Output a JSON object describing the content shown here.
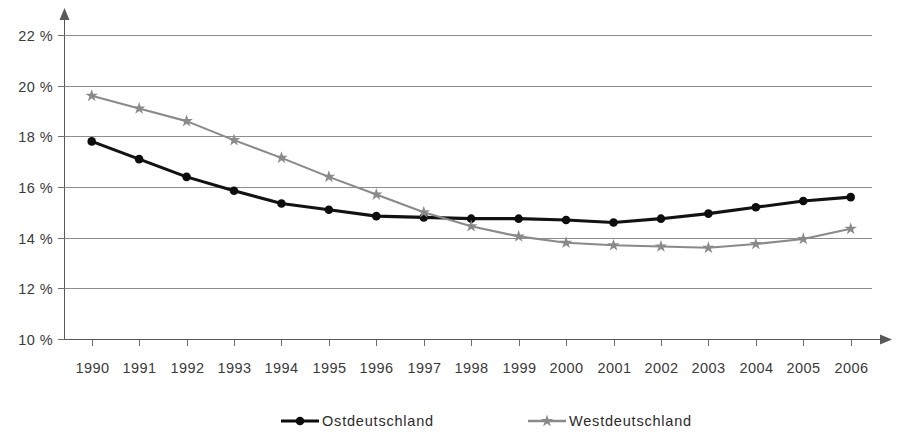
{
  "chart_data": {
    "type": "line",
    "title": "",
    "subtitle": "",
    "xlabel": "",
    "ylabel": "",
    "grid": true,
    "legend_position": "bottom",
    "xlim": [
      1990,
      2006
    ],
    "ylim": [
      10,
      22
    ],
    "ytick_labels": [
      "22 %",
      "20 %",
      "18 %",
      "16 %",
      "14 %",
      "12 %",
      "10 %"
    ],
    "ytick_values": [
      22,
      20,
      18,
      16,
      14,
      12,
      10
    ],
    "x": [
      1990,
      1991,
      1992,
      1993,
      1994,
      1995,
      1996,
      1997,
      1998,
      1999,
      2000,
      2001,
      2002,
      2003,
      2004,
      2005,
      2006
    ],
    "categories": [
      "1990",
      "1991",
      "1992",
      "1993",
      "1994",
      "1995",
      "1996",
      "1997",
      "1998",
      "1999",
      "2000",
      "2001",
      "2002",
      "2003",
      "2004",
      "2005",
      "2006"
    ],
    "series": [
      {
        "name": "Ostdeutschland",
        "color": "#0d0d0d",
        "marker": "circle",
        "values": [
          17.8,
          17.1,
          16.4,
          15.85,
          15.35,
          15.1,
          14.85,
          14.8,
          14.75,
          14.75,
          14.7,
          14.6,
          14.75,
          14.95,
          15.2,
          15.45,
          15.6
        ]
      },
      {
        "name": "Westdeutschland",
        "color": "#8a8a8a",
        "marker": "star",
        "values": [
          19.6,
          19.1,
          18.6,
          17.85,
          17.15,
          16.4,
          15.7,
          15.0,
          14.45,
          14.05,
          13.8,
          13.7,
          13.65,
          13.6,
          13.75,
          13.95,
          14.35
        ]
      }
    ]
  },
  "legend": {
    "items": [
      {
        "label": "Ostdeutschland",
        "color": "#0d0d0d",
        "marker": "circle"
      },
      {
        "label": "Westdeutschland",
        "color": "#8a8a8a",
        "marker": "star"
      }
    ]
  }
}
